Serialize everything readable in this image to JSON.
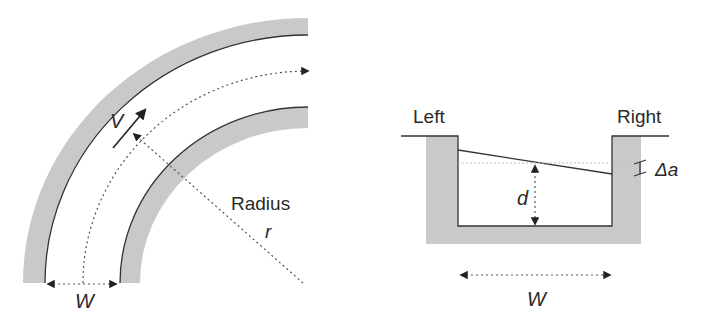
{
  "colors": {
    "wall_fill": "#c9c9c9",
    "line": "#333333",
    "dotted": "#555555",
    "text": "#2a2a2a"
  },
  "bend_diagram": {
    "velocity_label": "V",
    "radius_label": "Radius",
    "radius_symbol": "r",
    "width_label": "W"
  },
  "cross_section_diagram": {
    "left_bank_label": "Left",
    "right_bank_label": "Right",
    "depth_label": "d",
    "superelevation_label": "Δa",
    "width_label": "W"
  }
}
